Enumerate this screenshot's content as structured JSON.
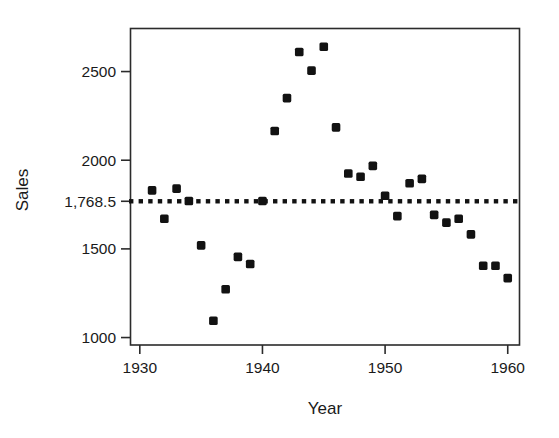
{
  "chart_data": {
    "type": "scatter",
    "title": "",
    "xlabel": "Year",
    "ylabel": "Sales",
    "xlim": [
      1929.2,
      1961.0
    ],
    "ylim": [
      958,
      2740
    ],
    "grid": false,
    "legend": null,
    "x_ticks": [
      1930,
      1940,
      1950,
      1960
    ],
    "x_tick_labels": [
      "1930",
      "1940",
      "1950",
      "1960"
    ],
    "y_ticks": [
      1000,
      1500,
      1768.5,
      2000,
      2500
    ],
    "y_tick_labels": [
      "1000",
      "1500",
      "1,768.5",
      "2000",
      "2500"
    ],
    "reference_line": {
      "style": "dotted",
      "orientation": "horizontal",
      "value": 1768.5,
      "label": "1,768.5",
      "color": "#121212"
    },
    "x": [
      1931,
      1932,
      1933,
      1934,
      1935,
      1936,
      1937,
      1938,
      1939,
      1940,
      1941,
      1942,
      1943,
      1944,
      1945,
      1946,
      1947,
      1948,
      1949,
      1950,
      1951,
      1952,
      1953,
      1954,
      1955,
      1956,
      1957,
      1958,
      1959,
      1960
    ],
    "y": [
      1830,
      1670,
      1840,
      1770,
      1520,
      1095,
      1272,
      1455,
      1415,
      1770,
      2165,
      2350,
      2610,
      2505,
      2640,
      2185,
      1925,
      1907,
      1968,
      1800,
      1685,
      1870,
      1895,
      1692,
      1648,
      1670,
      1582,
      1405,
      1405,
      1335
    ],
    "series": [
      {
        "name": "Sales",
        "marker": "square",
        "color": "#121212",
        "points": [
          {
            "year": 1931,
            "sales": 1830
          },
          {
            "year": 1932,
            "sales": 1670
          },
          {
            "year": 1933,
            "sales": 1840
          },
          {
            "year": 1934,
            "sales": 1770
          },
          {
            "year": 1935,
            "sales": 1520
          },
          {
            "year": 1936,
            "sales": 1095
          },
          {
            "year": 1937,
            "sales": 1272
          },
          {
            "year": 1938,
            "sales": 1455
          },
          {
            "year": 1939,
            "sales": 1415
          },
          {
            "year": 1940,
            "sales": 1770
          },
          {
            "year": 1941,
            "sales": 2165
          },
          {
            "year": 1942,
            "sales": 2350
          },
          {
            "year": 1943,
            "sales": 2610
          },
          {
            "year": 1944,
            "sales": 2505
          },
          {
            "year": 1945,
            "sales": 2640
          },
          {
            "year": 1946,
            "sales": 2185
          },
          {
            "year": 1947,
            "sales": 1925
          },
          {
            "year": 1948,
            "sales": 1907
          },
          {
            "year": 1949,
            "sales": 1968
          },
          {
            "year": 1950,
            "sales": 1800
          },
          {
            "year": 1951,
            "sales": 1685
          },
          {
            "year": 1952,
            "sales": 1870
          },
          {
            "year": 1953,
            "sales": 1895
          },
          {
            "year": 1954,
            "sales": 1692
          },
          {
            "year": 1955,
            "sales": 1648
          },
          {
            "year": 1956,
            "sales": 1670
          },
          {
            "year": 1957,
            "sales": 1582
          },
          {
            "year": 1958,
            "sales": 1405
          },
          {
            "year": 1959,
            "sales": 1405
          },
          {
            "year": 1960,
            "sales": 1335
          }
        ]
      }
    ]
  },
  "axes": {
    "x_title": "Year",
    "y_title": "Sales"
  },
  "colors": {
    "marker": "#121212",
    "axis": "#2b2b2b",
    "background": "#ffffff",
    "reference_line": "#121212"
  }
}
